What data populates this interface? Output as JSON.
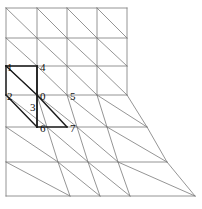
{
  "figure": {
    "name": "triangular-finite-element-mesh",
    "background_color": "#ffffff",
    "line_color": "#7a7a7a",
    "highlight_line_color": "#1a1a1a",
    "label_color": "#111111",
    "line_width": 0.8,
    "highlight_line_width": 1.4
  },
  "node_labels": [
    {
      "id": "0",
      "text": "0",
      "x": 40,
      "y": 100
    },
    {
      "id": "1",
      "text": "1",
      "x": 7,
      "y": 71
    },
    {
      "id": "2",
      "text": "2",
      "x": 7,
      "y": 100
    },
    {
      "id": "3",
      "text": "3",
      "x": 30,
      "y": 111
    },
    {
      "id": "4",
      "text": "4",
      "x": 40,
      "y": 71
    },
    {
      "id": "5",
      "text": "5",
      "x": 70,
      "y": 100
    },
    {
      "id": "6",
      "text": "6",
      "x": 40,
      "y": 132
    },
    {
      "id": "7",
      "text": "7",
      "x": 70,
      "y": 132
    }
  ],
  "grid": {
    "rows": [
      {
        "y": 8,
        "x_start": 6,
        "x_end": 127
      },
      {
        "y": 38,
        "x_start": 6,
        "x_end": 127
      },
      {
        "y": 66,
        "x_start": 6,
        "x_end": 127
      },
      {
        "y": 95,
        "x_start": 6,
        "x_end": 127
      },
      {
        "y": 127,
        "x_start": 6,
        "x_end": 147
      },
      {
        "y": 162,
        "x_start": 6,
        "x_end": 167
      },
      {
        "y": 196,
        "x_start": 6,
        "x_end": 195
      }
    ],
    "columns_upper": [
      6,
      37,
      67,
      97,
      127
    ],
    "right_edge_points": [
      {
        "x": 127,
        "y": 95
      },
      {
        "x": 147,
        "y": 127
      },
      {
        "x": 167,
        "y": 162
      },
      {
        "x": 195,
        "y": 196
      }
    ],
    "left_edge": {
      "x": 6,
      "y_top": 8,
      "y_bottom": 196
    }
  },
  "mesh_lines": {
    "horizontals": [
      [
        6,
        8,
        127,
        8
      ],
      [
        6,
        38,
        127,
        38
      ],
      [
        6,
        66,
        127,
        66
      ],
      [
        6,
        95,
        127,
        95
      ],
      [
        6,
        127,
        147,
        127
      ],
      [
        6,
        162,
        167,
        162
      ],
      [
        6,
        196,
        195,
        196
      ]
    ],
    "verticals": [
      [
        6,
        8,
        6,
        196
      ],
      [
        37,
        8,
        37,
        95
      ],
      [
        67,
        8,
        67,
        95
      ],
      [
        97,
        8,
        97,
        95
      ],
      [
        127,
        8,
        127,
        95
      ],
      [
        37,
        95,
        47,
        127
      ],
      [
        67,
        95,
        77,
        127
      ],
      [
        97,
        95,
        107,
        127
      ],
      [
        127,
        95,
        147,
        127
      ],
      [
        47,
        127,
        58,
        162
      ],
      [
        77,
        127,
        88,
        162
      ],
      [
        107,
        127,
        118,
        162
      ],
      [
        147,
        127,
        167,
        162
      ],
      [
        58,
        162,
        70,
        196
      ],
      [
        88,
        162,
        100,
        196
      ],
      [
        118,
        162,
        130,
        196
      ],
      [
        167,
        162,
        195,
        196
      ]
    ],
    "diagonals": [
      [
        6,
        8,
        37,
        38
      ],
      [
        37,
        8,
        67,
        38
      ],
      [
        67,
        8,
        97,
        38
      ],
      [
        97,
        8,
        127,
        38
      ],
      [
        6,
        38,
        37,
        66
      ],
      [
        37,
        38,
        67,
        66
      ],
      [
        67,
        38,
        97,
        66
      ],
      [
        97,
        38,
        127,
        66
      ],
      [
        6,
        66,
        37,
        95
      ],
      [
        37,
        66,
        67,
        95
      ],
      [
        67,
        66,
        97,
        95
      ],
      [
        97,
        66,
        127,
        95
      ],
      [
        6,
        95,
        47,
        127
      ],
      [
        37,
        95,
        77,
        127
      ],
      [
        67,
        95,
        107,
        127
      ],
      [
        97,
        95,
        147,
        127
      ],
      [
        6,
        127,
        58,
        162
      ],
      [
        47,
        127,
        88,
        162
      ],
      [
        77,
        127,
        118,
        162
      ],
      [
        107,
        127,
        167,
        162
      ],
      [
        6,
        162,
        70,
        196
      ],
      [
        58,
        162,
        100,
        196
      ],
      [
        88,
        162,
        130,
        196
      ],
      [
        118,
        162,
        195,
        196
      ]
    ]
  },
  "highlighted_element": {
    "description": "patch-around-node-0",
    "edges": [
      [
        6,
        66,
        37,
        66
      ],
      [
        6,
        66,
        6,
        95
      ],
      [
        37,
        66,
        37,
        95
      ],
      [
        37,
        66,
        37,
        127
      ],
      [
        6,
        66,
        37,
        95
      ],
      [
        37,
        95,
        37,
        127
      ],
      [
        37,
        127,
        67,
        127
      ],
      [
        37,
        95,
        67,
        127
      ],
      [
        6,
        95,
        37,
        127
      ]
    ]
  }
}
